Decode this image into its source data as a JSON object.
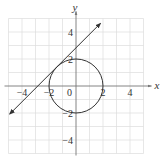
{
  "chart_data": {
    "type": "line",
    "title": "",
    "xlabel": "x",
    "ylabel": "y",
    "xlim": [
      -5,
      5
    ],
    "ylim": [
      -5,
      5
    ],
    "grid": true,
    "grid_step": 1,
    "x_ticks": [
      {
        "value": -4,
        "label": "−4"
      },
      {
        "value": -2,
        "label": "−2"
      },
      {
        "value": 0,
        "label": "0"
      },
      {
        "value": 2,
        "label": "2"
      },
      {
        "value": 4,
        "label": "4"
      }
    ],
    "y_ticks": [
      {
        "value": 4,
        "label": "4"
      },
      {
        "value": 2,
        "label": "2"
      },
      {
        "value": -2,
        "label": "−2"
      },
      {
        "value": -4,
        "label": "−4"
      }
    ],
    "series": [
      {
        "name": "circle",
        "kind": "circle",
        "center": [
          0,
          0
        ],
        "radius": 2
      },
      {
        "name": "tangent-line",
        "kind": "line",
        "slope": 1,
        "intercept": 2.83,
        "x_range": [
          -4.9,
          1.8
        ],
        "arrows": true
      }
    ],
    "colors": {
      "curve": "#333333",
      "grid": "#dddddd",
      "axis": "#777777"
    }
  }
}
